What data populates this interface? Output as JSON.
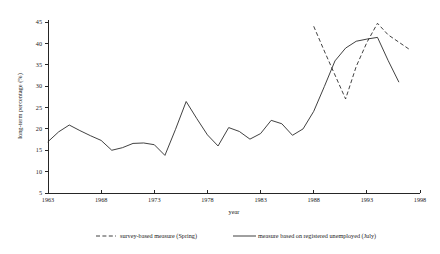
{
  "chart_data": {
    "type": "line",
    "title": "",
    "xlabel": "year",
    "ylabel": "long-term percentage (%)",
    "xlim": [
      1963,
      1998
    ],
    "ylim": [
      5,
      45
    ],
    "grid": false,
    "legend_position": "bottom",
    "xticks": [
      "1963",
      "1968",
      "1973",
      "1978",
      "1983",
      "1988",
      "1993",
      "1998"
    ],
    "xtick_values": [
      1963,
      1968,
      1973,
      1978,
      1983,
      1988,
      1993,
      1998
    ],
    "yticks": [
      "5",
      "10",
      "15",
      "20",
      "25",
      "30",
      "35",
      "40",
      "45"
    ],
    "ytick_values": [
      5,
      10,
      15,
      20,
      25,
      30,
      35,
      40,
      45
    ],
    "series": [
      {
        "name": "measure based on registered unemployed (July)",
        "style": "solid",
        "color": "#2b2b2b",
        "x": [
          1963,
          1964,
          1965,
          1966,
          1967,
          1968,
          1969,
          1970,
          1971,
          1972,
          1973,
          1974,
          1975,
          1976,
          1977,
          1978,
          1979,
          1980,
          1981,
          1982,
          1983,
          1984,
          1985,
          1986,
          1987,
          1988,
          1989,
          1990,
          1991,
          1992,
          1993,
          1994
        ],
        "values": [
          17.0,
          19.3,
          20.9,
          19.6,
          18.4,
          17.3,
          15.0,
          15.6,
          16.6,
          16.7,
          16.3,
          13.8,
          19.9,
          26.4,
          22.4,
          18.6,
          16.0,
          20.3,
          19.4,
          17.6,
          18.9,
          22.0,
          21.2,
          18.5,
          20.0,
          24.1,
          29.9,
          35.9,
          38.9,
          40.5,
          41.0,
          41.4
        ]
      },
      {
        "name": "survey-based measure (Spring)",
        "style": "dashed",
        "color": "#2b2b2b",
        "x": [
          1988,
          1989,
          1990,
          1991,
          1992,
          1993,
          1994,
          1995,
          1996,
          1997
        ],
        "values": [
          44.0,
          38.2,
          32.6,
          27.0,
          34.6,
          40.2,
          44.7,
          42.0,
          40.3,
          38.6
        ]
      }
    ],
    "series_extra_solid_tail": {
      "x": [
        1994,
        1995,
        1996
      ],
      "values": [
        41.4,
        36.0,
        31.0
      ]
    }
  },
  "legend": {
    "entries": [
      {
        "label": "survey-based measure (Spring)",
        "style": "dashed"
      },
      {
        "label": "measure based on registered unemployed (July)",
        "style": "solid"
      }
    ]
  },
  "axis": {
    "x_title": "year",
    "y_title": "long-term percentage (%)"
  }
}
